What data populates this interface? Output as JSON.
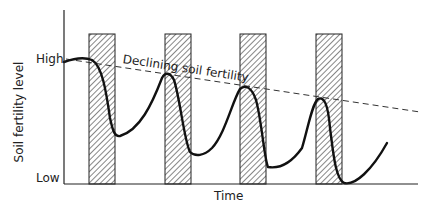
{
  "diagram": {
    "y_axis_label": "Soil fertility level",
    "y_high_label": "High",
    "y_low_label": "Low",
    "x_axis_label": "Time",
    "trend_label": "Declining soil fertility",
    "bars_count": 4
  },
  "colors": {
    "ink": "#111111",
    "background": "#ffffff"
  }
}
